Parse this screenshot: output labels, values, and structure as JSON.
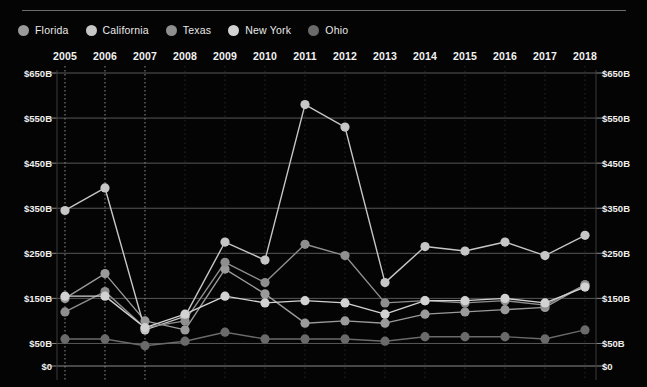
{
  "legend": {
    "items": [
      {
        "label": "Florida",
        "color": "#9a9a9a",
        "marker": "legend-dot-florida"
      },
      {
        "label": "California",
        "color": "#c6c6c6",
        "marker": "legend-dot-california"
      },
      {
        "label": "Texas",
        "color": "#8f8f8f",
        "marker": "legend-dot-texas"
      },
      {
        "label": "New York",
        "color": "#d2d2d2",
        "marker": "legend-dot-newyork"
      },
      {
        "label": "Ohio",
        "color": "#6a6a6a",
        "marker": "legend-dot-ohio"
      }
    ]
  },
  "axis": {
    "y_tick_labels": [
      "$650B",
      "$550B",
      "$450B",
      "$350B",
      "$250B",
      "$150B",
      "$50B",
      "$0"
    ],
    "y_tick_values": [
      650,
      550,
      450,
      350,
      250,
      150,
      50,
      0
    ],
    "x_tick_labels": [
      "2005",
      "2006",
      "2007",
      "2008",
      "2009",
      "2010",
      "2011",
      "2012",
      "2013",
      "2014",
      "2015",
      "2016",
      "2017",
      "2018"
    ]
  },
  "chart_data": {
    "type": "line",
    "title": "",
    "xlabel": "",
    "ylabel": "",
    "ylim": [
      0,
      650
    ],
    "grid": true,
    "legend_position": "top-left",
    "x_axis_position": "top",
    "y_axis_position": "both",
    "categories": [
      "2005",
      "2006",
      "2007",
      "2008",
      "2009",
      "2010",
      "2011",
      "2012",
      "2013",
      "2014",
      "2015",
      "2016",
      "2017",
      "2018"
    ],
    "series": [
      {
        "name": "Florida",
        "color": "#9a9a9a",
        "values": [
          150,
          205,
          100,
          80,
          215,
          160,
          95,
          100,
          95,
          115,
          120,
          125,
          130,
          180
        ]
      },
      {
        "name": "California",
        "color": "#c6c6c6",
        "values": [
          345,
          395,
          80,
          110,
          275,
          235,
          580,
          530,
          185,
          265,
          255,
          275,
          245,
          290
        ]
      },
      {
        "name": "Texas",
        "color": "#8f8f8f",
        "values": [
          120,
          165,
          85,
          100,
          230,
          185,
          270,
          245,
          140,
          145,
          140,
          145,
          135,
          180
        ]
      },
      {
        "name": "New York",
        "color": "#d2d2d2",
        "values": [
          155,
          155,
          85,
          115,
          155,
          140,
          145,
          140,
          115,
          145,
          145,
          150,
          140,
          175
        ]
      },
      {
        "name": "Ohio",
        "color": "#6a6a6a",
        "values": [
          60,
          60,
          45,
          55,
          75,
          60,
          60,
          60,
          55,
          65,
          65,
          65,
          60,
          80
        ]
      }
    ]
  }
}
